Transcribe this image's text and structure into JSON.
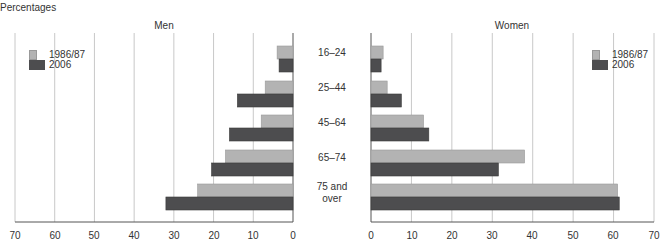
{
  "chart_data": [
    {
      "type": "bar",
      "orientation": "horizontal",
      "title": "Men",
      "ylabel": "Percentages",
      "xlim": [
        70,
        0
      ],
      "xticks": [
        "70",
        "60",
        "50",
        "40",
        "30",
        "20",
        "10",
        "0"
      ],
      "grid": true,
      "categories": [
        "16–24",
        "25–44",
        "45–64",
        "65–74",
        "75 and over"
      ],
      "series": [
        {
          "name": "1986/87",
          "color": "#b3b3b3",
          "values": [
            4,
            7,
            8,
            17,
            24
          ]
        },
        {
          "name": "2006",
          "color": "#4d4d4f",
          "values": [
            3.5,
            14,
            16,
            20.5,
            32
          ]
        }
      ],
      "legend_position": "upper-left"
    },
    {
      "type": "bar",
      "orientation": "horizontal",
      "title": "Women",
      "ylabel": "Percentages",
      "xlim": [
        0,
        70
      ],
      "xticks": [
        "0",
        "10",
        "20",
        "30",
        "40",
        "50",
        "60",
        "70"
      ],
      "grid": true,
      "categories": [
        "16–24",
        "25–44",
        "45–64",
        "65–74",
        "75 and over"
      ],
      "series": [
        {
          "name": "1986/87",
          "color": "#b3b3b3",
          "values": [
            3,
            4,
            13,
            38,
            61
          ]
        },
        {
          "name": "2006",
          "color": "#4d4d4f",
          "values": [
            2.5,
            7.5,
            14.3,
            31.5,
            61.4
          ]
        }
      ],
      "legend_position": "upper-right"
    }
  ],
  "labels": {
    "ylabel": "Percentages",
    "men_title": "Men",
    "women_title": "Women",
    "categories": [
      "16–24",
      "25–44",
      "45–64",
      "65–74",
      "75 and"
    ],
    "category_last_line2": "over",
    "legend": [
      "1986/87",
      "2006"
    ],
    "men_ticks": [
      "70",
      "60",
      "50",
      "40",
      "30",
      "20",
      "10",
      "0"
    ],
    "women_ticks": [
      "0",
      "10",
      "20",
      "30",
      "40",
      "50",
      "60",
      "70"
    ]
  }
}
